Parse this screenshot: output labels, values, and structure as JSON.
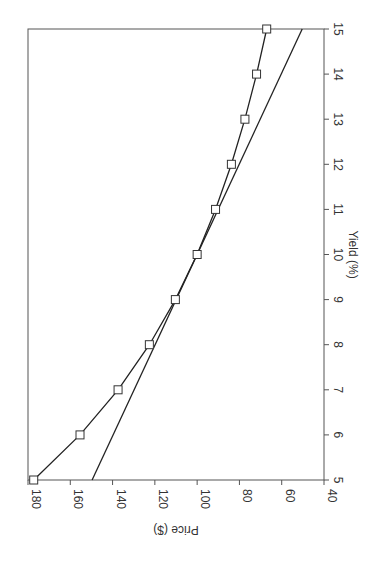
{
  "chart_data": {
    "type": "line",
    "orientation": "rotated 90 degrees clockwise",
    "title": "",
    "xlabel": "Yield (%)",
    "ylabel": "Price ($)",
    "xlim": [
      5,
      15
    ],
    "ylim": [
      40,
      180
    ],
    "x_ticks": [
      5,
      6,
      7,
      8,
      9,
      10,
      11,
      12,
      13,
      14,
      15
    ],
    "y_ticks": [
      40,
      60,
      80,
      100,
      120,
      140,
      160,
      180
    ],
    "x_tick_labels": [
      "5",
      "6",
      "7",
      "8",
      "9",
      "10",
      "11",
      "12",
      "13",
      "14",
      "15"
    ],
    "y_tick_labels": [
      "40",
      "60",
      "80",
      "100",
      "120",
      "140",
      "160",
      "180"
    ],
    "grid": false,
    "legend": "none",
    "series": [
      {
        "name": "Bond price",
        "marker": "square",
        "x": [
          5,
          6,
          7,
          8,
          9,
          10,
          11,
          12,
          13,
          14,
          15
        ],
        "y": [
          177.3,
          155.4,
          137.4,
          122.6,
          110.3,
          100.0,
          91.3,
          83.8,
          77.4,
          71.9,
          67.1
        ]
      },
      {
        "name": "Tangent line (duration approximation)",
        "marker": "none",
        "x": [
          5,
          15
        ],
        "y": [
          149.7,
          50.3
        ]
      }
    ]
  }
}
